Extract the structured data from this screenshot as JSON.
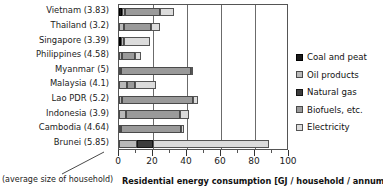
{
  "chart_data": {
    "type": "bar",
    "orientation": "horizontal",
    "stacked": true,
    "title": "",
    "xlabel": "Residential energy consumption [GJ / household / annum]",
    "ylabel": "",
    "xlim": [
      0,
      100
    ],
    "xticks": [
      0,
      20,
      40,
      60,
      80,
      100
    ],
    "xtick_labels": [
      "0",
      "20",
      "40",
      "60",
      "80",
      "100"
    ],
    "minor_xticks": [
      10,
      30,
      50,
      70,
      90
    ],
    "grid": "vertical",
    "legend_position": "right",
    "categories": [
      "Vietnam (3.83)",
      "Thailand (3.2)",
      "Singapore (3.39)",
      "Philippines (4.58)",
      "Myanmar (5)",
      "Malaysia (4.1)",
      "Lao PDR (5.2)",
      "Indonesia (3.9)",
      "Cambodia (4.64)",
      "Brunei (5.85)"
    ],
    "series": [
      {
        "name": "Coal and peat",
        "color": "#1a1a1a",
        "class": "s-coal",
        "values": [
          1.6,
          0.0,
          1.3,
          0.0,
          0.0,
          0.0,
          0.0,
          0.0,
          0.0,
          0.0
        ]
      },
      {
        "name": "Oil products",
        "color": "#b9b9b9",
        "class": "s-oil",
        "values": [
          2.2,
          2.8,
          1.5,
          2.0,
          0.5,
          4.8,
          1.5,
          4.0,
          1.2,
          10.8
        ]
      },
      {
        "name": "Natural gas",
        "color": "#3c3c3c",
        "class": "s-gas",
        "values": [
          0.0,
          0.0,
          0.0,
          0.0,
          0.0,
          0.0,
          0.0,
          0.0,
          0.0,
          9.0
        ]
      },
      {
        "name": "Biofuels, etc.",
        "color": "#9a9a9a",
        "class": "s-bio",
        "values": [
          20.6,
          16.2,
          0.0,
          7.5,
          41.8,
          4.6,
          42.3,
          32.0,
          35.0,
          0.0
        ]
      },
      {
        "name": "Electricity",
        "color": "#dcdcdc",
        "class": "s-elec",
        "values": [
          7.8,
          5.0,
          15.4,
          3.2,
          1.0,
          12.6,
          2.6,
          5.0,
          2.0,
          68.4
        ]
      }
    ],
    "totals": [
      32.2,
      24.0,
      18.2,
      12.7,
      43.3,
      22.0,
      46.4,
      41.0,
      38.2,
      88.2
    ]
  },
  "legend": {
    "items": [
      {
        "label": "Coal and peat"
      },
      {
        "label": "Oil products"
      },
      {
        "label": "Natural gas"
      },
      {
        "label": "Biofuels, etc."
      },
      {
        "label": "Electricity"
      }
    ]
  },
  "annotation": {
    "text": "(average size of household)"
  }
}
